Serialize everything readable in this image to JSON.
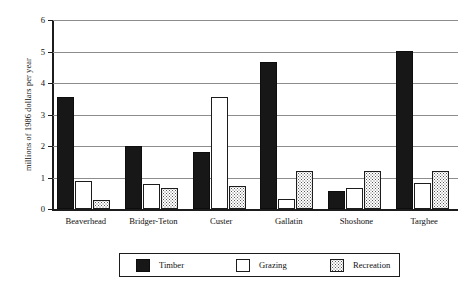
{
  "chart_data": {
    "type": "bar",
    "title": "",
    "xlabel": "",
    "ylabel": "millions of 1986 dollars per year",
    "ylim": [
      0,
      6
    ],
    "yticks": [
      0,
      1,
      2,
      3,
      4,
      5,
      6
    ],
    "grid": true,
    "legend_position": "bottom",
    "categories": [
      "Beaverhead",
      "Bridger-Teton",
      "Custer",
      "Gallatin",
      "Shoshone",
      "Targhee"
    ],
    "series": [
      {
        "name": "Timber",
        "color": "#171717",
        "fill": "solid-black",
        "values": [
          3.55,
          2.0,
          1.8,
          4.68,
          0.58,
          5.02
        ]
      },
      {
        "name": "Grazing",
        "color": "#ffffff",
        "fill": "white",
        "values": [
          0.88,
          0.8,
          3.55,
          0.32,
          0.68,
          0.82
        ]
      },
      {
        "name": "Recreation",
        "color": "#c8c8c8",
        "fill": "dotted",
        "values": [
          0.3,
          0.68,
          0.72,
          1.2,
          1.22,
          1.2
        ]
      }
    ]
  },
  "axis": {
    "y_title": "millions of 1986 dollars per year",
    "y_tick_labels": [
      "0",
      "1",
      "2",
      "3",
      "4",
      "5",
      "6"
    ]
  },
  "legend": {
    "items": [
      {
        "label": "Timber"
      },
      {
        "label": "Grazing"
      },
      {
        "label": "Recreation"
      }
    ]
  }
}
